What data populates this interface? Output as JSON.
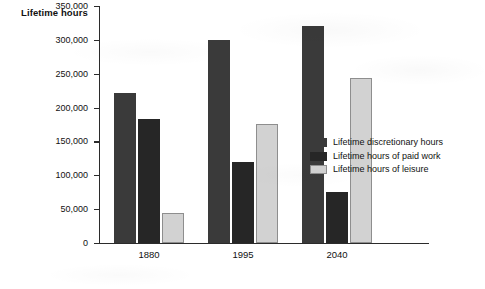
{
  "chart_data": {
    "type": "bar",
    "title": "",
    "ylabel": "Lifetime hours",
    "xlabel": "",
    "categories": [
      "1880",
      "1995",
      "2040"
    ],
    "series": [
      {
        "name": "Lifetime discretionary hours",
        "color": "#3a3a3a",
        "values": [
          222000,
          300000,
          320000
        ]
      },
      {
        "name": "Lifetime hours of paid work",
        "color": "#262626",
        "values": [
          183000,
          120000,
          75000
        ]
      },
      {
        "name": "Lifetime hours of leisure",
        "color": "#d2d2d2",
        "values": [
          45000,
          176000,
          243000
        ]
      }
    ],
    "ylim": [
      0,
      350000
    ],
    "yticks": [
      0,
      50000,
      100000,
      150000,
      200000,
      250000,
      300000,
      350000
    ],
    "ytick_labels": [
      "0",
      "50,000",
      "100,000",
      "150,000",
      "200,000",
      "250,000",
      "300,000",
      "350,000"
    ],
    "grid": false,
    "legend_position": "right"
  },
  "axes": {
    "y_title": "Lifetime hours"
  },
  "legend": {
    "entries": [
      {
        "label": "Lifetime discretionary hours",
        "swatch": "sw-discretionary"
      },
      {
        "label": "Lifetime hours of paid work",
        "swatch": "sw-paidwork"
      },
      {
        "label": "Lifetime hours of leisure",
        "swatch": "sw-leisure"
      }
    ]
  }
}
